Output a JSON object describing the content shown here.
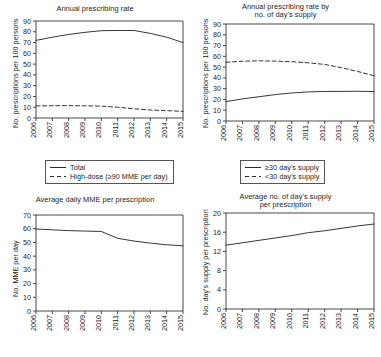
{
  "figure": {
    "background": "#ffffff",
    "line_color": "#2b2b2b"
  },
  "panels": [
    {
      "id": "panel-annual-prescribing-rate",
      "title_line1": "Annual prescribing rate",
      "title_line2": "",
      "ylabel": "No. prescriptions per 100 persons",
      "legend": [
        {
          "label": "Total",
          "style": "solid"
        },
        {
          "label": "High-dose (≥90 MME per day)",
          "style": "dashed"
        }
      ]
    },
    {
      "id": "panel-annual-prescribing-rate-by-days-supply",
      "title_line1": "Annual prescribing rate by",
      "title_line2": "no. of day's supply",
      "ylabel": "No. prescriptions per 100 persons",
      "legend": [
        {
          "label": "≥30 day's supply",
          "style": "solid"
        },
        {
          "label": "<30 day's supply",
          "style": "dashed"
        }
      ]
    },
    {
      "id": "panel-average-daily-mme",
      "title_line1": "Average daily MME per prescription",
      "title_line2": "",
      "ylabel": "No. MME per day",
      "legend": []
    },
    {
      "id": "panel-average-days-supply",
      "title_line1": "Average no. of day's supply",
      "title_line2": "per prescription",
      "ylabel": "No. day's supply per prescription",
      "legend": []
    }
  ],
  "chart_data": [
    {
      "type": "line",
      "title": "Annual prescribing rate",
      "xlabel": "",
      "ylabel": "No. prescriptions per 100 persons",
      "x": [
        2006,
        2007,
        2008,
        2009,
        2010,
        2011,
        2012,
        2013,
        2014,
        2015
      ],
      "xtick_labels": [
        "2006",
        "2007",
        "2008",
        "2009",
        "2010",
        "2011",
        "2012",
        "2013",
        "2014",
        "2015"
      ],
      "ylim": [
        0,
        90
      ],
      "yticks": [
        0,
        10,
        20,
        30,
        40,
        50,
        60,
        70,
        80,
        90
      ],
      "grid": false,
      "legend_position": "below",
      "series": [
        {
          "name": "Total",
          "style": "solid",
          "values": [
            72.0,
            75.0,
            77.5,
            79.5,
            81.0,
            81.2,
            81.2,
            78.5,
            75.0,
            70.0
          ]
        },
        {
          "name": "High-dose (≥90 MME per day)",
          "style": "dashed",
          "values": [
            11.2,
            11.4,
            11.5,
            11.3,
            11.0,
            10.0,
            8.6,
            7.4,
            6.8,
            6.2
          ]
        }
      ]
    },
    {
      "type": "line",
      "title": "Annual prescribing rate by no. of day's supply",
      "xlabel": "",
      "ylabel": "No. prescriptions per 100 persons",
      "x": [
        2006,
        2007,
        2008,
        2009,
        2010,
        2011,
        2012,
        2013,
        2014,
        2015
      ],
      "xtick_labels": [
        "2006",
        "2007",
        "2008",
        "2009",
        "2010",
        "2011",
        "2012",
        "2013",
        "2014",
        "2015"
      ],
      "ylim": [
        0,
        90
      ],
      "yticks": [
        0,
        10,
        20,
        30,
        40,
        50,
        60,
        70,
        80,
        90
      ],
      "grid": false,
      "legend_position": "below",
      "series": [
        {
          "name": "≥30 day's supply",
          "style": "solid",
          "values": [
            18.0,
            20.5,
            22.5,
            24.5,
            26.0,
            27.0,
            27.4,
            27.5,
            27.6,
            27.3
          ]
        },
        {
          "name": "<30 day's supply",
          "style": "dashed",
          "values": [
            54.5,
            55.5,
            55.8,
            55.6,
            55.0,
            54.0,
            52.5,
            49.5,
            46.0,
            42.0
          ]
        }
      ]
    },
    {
      "type": "line",
      "title": "Average daily MME per prescription",
      "xlabel": "",
      "ylabel": "No. MME per day",
      "x": [
        2006,
        2007,
        2008,
        2009,
        2010,
        2011,
        2012,
        2013,
        2014,
        2015
      ],
      "xtick_labels": [
        "2006",
        "2007",
        "2008",
        "2009",
        "2010",
        "2011",
        "2012",
        "2013",
        "2014",
        "2015"
      ],
      "ylim": [
        0,
        70
      ],
      "yticks": [
        0,
        10,
        20,
        30,
        40,
        50,
        60,
        70
      ],
      "grid": false,
      "legend_position": "none",
      "series": [
        {
          "name": "Average daily MME per prescription",
          "style": "solid",
          "values": [
            59.8,
            59.2,
            58.6,
            58.3,
            58.0,
            53.0,
            51.0,
            49.5,
            48.3,
            47.5
          ]
        }
      ]
    },
    {
      "type": "line",
      "title": "Average no. of day's supply per prescription",
      "xlabel": "",
      "ylabel": "No. day's supply per prescription",
      "x": [
        2006,
        2007,
        2008,
        2009,
        2010,
        2011,
        2012,
        2013,
        2014,
        2015
      ],
      "xtick_labels": [
        "2006",
        "2007",
        "2008",
        "2009",
        "2010",
        "2011",
        "2012",
        "2013",
        "2014",
        "2015"
      ],
      "ylim": [
        0,
        20
      ],
      "yticks": [
        0,
        4,
        8,
        12,
        16,
        20
      ],
      "grid": false,
      "legend_position": "none",
      "series": [
        {
          "name": "Average no. of day's supply per prescription",
          "style": "solid",
          "values": [
            13.3,
            13.8,
            14.3,
            14.8,
            15.3,
            15.9,
            16.3,
            16.8,
            17.3,
            17.7
          ]
        }
      ]
    }
  ]
}
